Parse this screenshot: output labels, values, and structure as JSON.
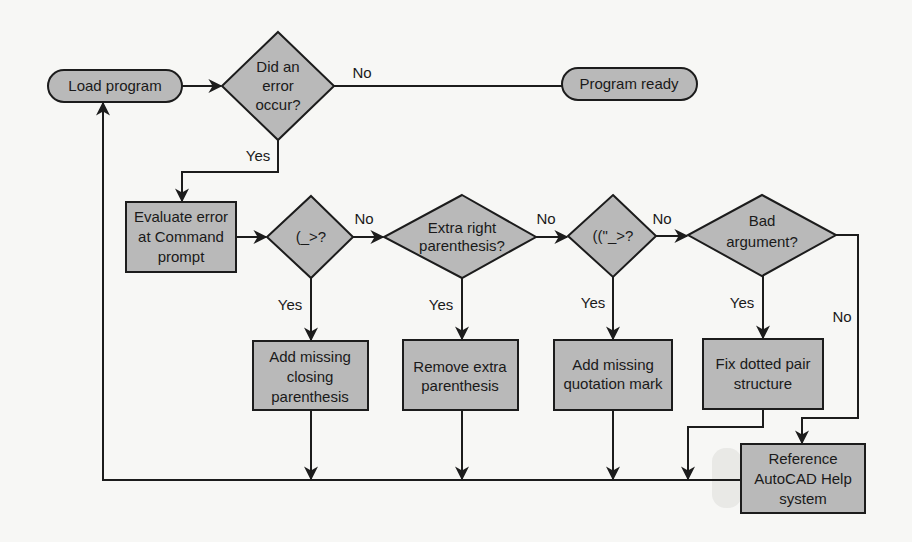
{
  "diagram": {
    "type": "flowchart",
    "colors": {
      "node_fill": "#b9b9b9",
      "stroke": "#1c1c1c",
      "background": "#f7f7f5",
      "text": "#1a1a1a"
    },
    "nodes": {
      "load_program": {
        "kind": "terminal",
        "lines": [
          "Load program"
        ]
      },
      "did_error_occur": {
        "kind": "decision",
        "lines": [
          "Did an",
          "error",
          "occur?"
        ]
      },
      "program_ready": {
        "kind": "terminal",
        "lines": [
          "Program ready"
        ]
      },
      "evaluate_error": {
        "kind": "process",
        "lines": [
          "Evaluate error",
          "at Command",
          "prompt"
        ]
      },
      "paren_prompt": {
        "kind": "decision",
        "lines": [
          "(_>?"
        ]
      },
      "extra_right_paren": {
        "kind": "decision",
        "lines": [
          "Extra right",
          "parenthesis?"
        ]
      },
      "quote_prompt": {
        "kind": "decision",
        "lines": [
          "((\"_>?"
        ]
      },
      "bad_argument": {
        "kind": "decision",
        "lines": [
          "Bad",
          "argument?"
        ]
      },
      "add_closing_paren": {
        "kind": "process",
        "lines": [
          "Add missing",
          "closing",
          "parenthesis"
        ]
      },
      "remove_extra_paren": {
        "kind": "process",
        "lines": [
          "Remove extra",
          "parenthesis"
        ]
      },
      "add_quotation_mark": {
        "kind": "process",
        "lines": [
          "Add missing",
          "quotation mark"
        ]
      },
      "fix_dotted_pair": {
        "kind": "process",
        "lines": [
          "Fix dotted pair",
          "structure"
        ]
      },
      "reference_help": {
        "kind": "process",
        "lines": [
          "Reference",
          "AutoCAD Help",
          "system"
        ]
      }
    },
    "edge_labels": {
      "error_no": "No",
      "error_yes": "Yes",
      "paren_no": "No",
      "paren_yes": "Yes",
      "extra_no": "No",
      "extra_yes": "Yes",
      "quote_no": "No",
      "quote_yes": "Yes",
      "bad_no": "No",
      "bad_yes": "Yes"
    },
    "edges": [
      {
        "from": "load_program",
        "to": "did_error_occur"
      },
      {
        "from": "did_error_occur",
        "to": "program_ready",
        "label": "No"
      },
      {
        "from": "did_error_occur",
        "to": "evaluate_error",
        "label": "Yes"
      },
      {
        "from": "evaluate_error",
        "to": "paren_prompt"
      },
      {
        "from": "paren_prompt",
        "to": "extra_right_paren",
        "label": "No"
      },
      {
        "from": "paren_prompt",
        "to": "add_closing_paren",
        "label": "Yes"
      },
      {
        "from": "extra_right_paren",
        "to": "quote_prompt",
        "label": "No"
      },
      {
        "from": "extra_right_paren",
        "to": "remove_extra_paren",
        "label": "Yes"
      },
      {
        "from": "quote_prompt",
        "to": "bad_argument",
        "label": "No"
      },
      {
        "from": "quote_prompt",
        "to": "add_quotation_mark",
        "label": "Yes"
      },
      {
        "from": "bad_argument",
        "to": "fix_dotted_pair",
        "label": "Yes"
      },
      {
        "from": "bad_argument",
        "to": "reference_help",
        "label": "No"
      },
      {
        "from": "add_closing_paren",
        "to": "load_program"
      },
      {
        "from": "remove_extra_paren",
        "to": "load_program"
      },
      {
        "from": "add_quotation_mark",
        "to": "load_program"
      },
      {
        "from": "fix_dotted_pair",
        "to": "load_program"
      },
      {
        "from": "reference_help",
        "to": "load_program"
      }
    ]
  }
}
